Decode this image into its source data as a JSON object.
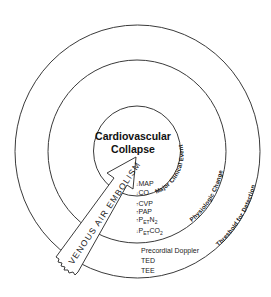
{
  "diagram": {
    "center": {
      "line1": "Cardiovascular",
      "line2": "Collapse"
    },
    "rings": {
      "inner_label": "Major Clinical Event",
      "middle_label": "Physiologic Change",
      "outer_label": "Threshold for Detection"
    },
    "arrow_label": "VENOUS AIR EMBOLISM",
    "inner_band_indicators": [
      {
        "arrow": "↓",
        "label": "MAP"
      },
      {
        "arrow": "↓",
        "label": "CO"
      }
    ],
    "middle_band_indicators": [
      {
        "arrow": "↑",
        "label": "CVP"
      },
      {
        "arrow": "↑",
        "label": "PAP"
      },
      {
        "arrow": "↑",
        "label": "P",
        "sub": "ET",
        "suffix": "N",
        "suffix_sub": "2"
      },
      {
        "arrow": "↓",
        "label": "P",
        "sub": "ET",
        "suffix": "CO",
        "suffix_sub": "2"
      }
    ],
    "outer_band_methods": [
      {
        "label": "Precordial Doppler"
      },
      {
        "label": "TED"
      },
      {
        "label": "TEE"
      }
    ],
    "colors": {
      "line": "#3a3a3a",
      "text": "#111111",
      "background": "#ffffff"
    }
  }
}
